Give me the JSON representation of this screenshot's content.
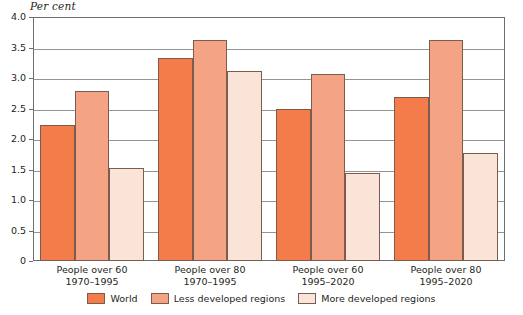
{
  "chart_data": {
    "type": "bar",
    "title": "",
    "subtitle": "",
    "xlabel": "",
    "ylabel": "Per cent",
    "ylim": [
      0,
      4.0
    ],
    "ytick_labels": [
      "4.0",
      "3.5",
      "3.0",
      "2.5",
      "2.0",
      "1.5",
      "1.0",
      "0.5",
      "0"
    ],
    "ytick_values": [
      4.0,
      3.5,
      3.0,
      2.5,
      2.0,
      1.5,
      1.0,
      0.5,
      0
    ],
    "grid": true,
    "legend_position": "bottom-center",
    "categories": [
      "People over 60\n1970–1995",
      "People over 80\n1970–1995",
      "People over 60\n1995–2020",
      "People over 80\n1995–2020"
    ],
    "category_lines": [
      [
        "People over 60",
        "1970–1995"
      ],
      [
        "People over 80",
        "1970–1995"
      ],
      [
        "People over 60",
        "1995–2020"
      ],
      [
        "People over 80",
        "1995–2020"
      ]
    ],
    "series": [
      {
        "name": "World",
        "color": "#F47B4A",
        "values": [
          2.23,
          3.33,
          2.5,
          2.69
        ]
      },
      {
        "name": "Less developed regions",
        "color": "#F4A384",
        "values": [
          2.78,
          3.62,
          3.06,
          3.62
        ]
      },
      {
        "name": "More developed regions",
        "color": "#FAE3D7",
        "values": [
          1.53,
          3.12,
          1.44,
          1.77
        ]
      }
    ]
  },
  "axis": {
    "unit_label": "Per cent"
  },
  "legend": {
    "items": [
      {
        "label": "World",
        "color": "#F47B4A"
      },
      {
        "label": "Less developed regions",
        "color": "#F4A384"
      },
      {
        "label": "More developed regions",
        "color": "#FAE3D7"
      }
    ]
  }
}
